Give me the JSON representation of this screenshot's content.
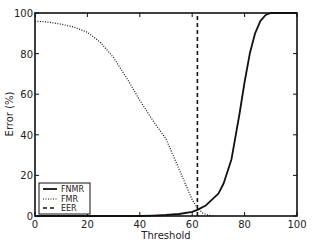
{
  "chart_data": {
    "type": "line",
    "title": "",
    "xlabel": "Threshold",
    "ylabel": "Error (%)",
    "xlim": [
      0,
      100
    ],
    "ylim": [
      0,
      100
    ],
    "xticks": [
      0,
      20,
      40,
      60,
      80,
      100
    ],
    "yticks": [
      0,
      20,
      40,
      60,
      80,
      100
    ],
    "grid": false,
    "legend_position": "lower left",
    "series": [
      {
        "name": "FNMR",
        "style": "solid",
        "x": [
          0,
          20,
          40,
          45,
          50,
          55,
          60,
          62,
          65,
          70,
          72,
          75,
          78,
          80,
          82,
          84,
          86,
          88,
          90,
          100
        ],
        "y": [
          0,
          0,
          0,
          0.2,
          0.5,
          1,
          2,
          3,
          5,
          11,
          16,
          28,
          50,
          66,
          80,
          90,
          96,
          99,
          100,
          100
        ]
      },
      {
        "name": "FMR",
        "style": "dotted",
        "x": [
          0,
          5,
          10,
          15,
          20,
          25,
          30,
          35,
          40,
          45,
          50,
          55,
          58,
          60,
          62,
          64,
          66,
          68
        ],
        "y": [
          96,
          95.5,
          94.5,
          93,
          90.5,
          85.5,
          78,
          68,
          57,
          47,
          38,
          23,
          14,
          8,
          4,
          1.5,
          0.5,
          0
        ]
      },
      {
        "name": "EER",
        "style": "dashed",
        "x": [
          62,
          62
        ],
        "y": [
          0,
          100
        ]
      }
    ]
  }
}
